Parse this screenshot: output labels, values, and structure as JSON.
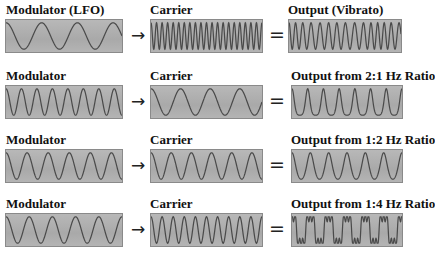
{
  "colors": {
    "panel_bg": "#b0b0b0",
    "wave": "#4a4a4a",
    "text": "#111111"
  },
  "operators": {
    "arrow": "→",
    "equals": "="
  },
  "rows": [
    {
      "modulator": {
        "label": "Modulator (LFO)",
        "cycles": 3.25
      },
      "carrier": {
        "label": "Carrier",
        "cycles": 20
      },
      "output": {
        "label": "Output (Vibrato)",
        "type": "vibrato",
        "cycles": 14,
        "depth": 0.5
      }
    },
    {
      "modulator": {
        "label": "Modulator",
        "cycles": 7.5
      },
      "carrier": {
        "label": "Carrier",
        "cycles": 3.75
      },
      "output": {
        "label": "Output from 2:1 Hz Ratio",
        "type": "fm",
        "ratio": "2:1",
        "cycles": 7,
        "index": 0.35
      }
    },
    {
      "modulator": {
        "label": "Modulator",
        "cycles": 5.5
      },
      "carrier": {
        "label": "Carrier",
        "cycles": 5.5
      },
      "output": {
        "label": "Output from 1:2 Hz Ratio",
        "type": "fm",
        "ratio": "1:2",
        "cycles": 6,
        "index": 0.15
      }
    },
    {
      "modulator": {
        "label": "Modulator",
        "cycles": 5
      },
      "carrier": {
        "label": "Carrier",
        "cycles": 10
      },
      "output": {
        "label": "Output from 1:4 Hz Ratio",
        "type": "fm_square",
        "ratio": "1:4",
        "cycles": 6,
        "index": 0.6
      }
    }
  ]
}
